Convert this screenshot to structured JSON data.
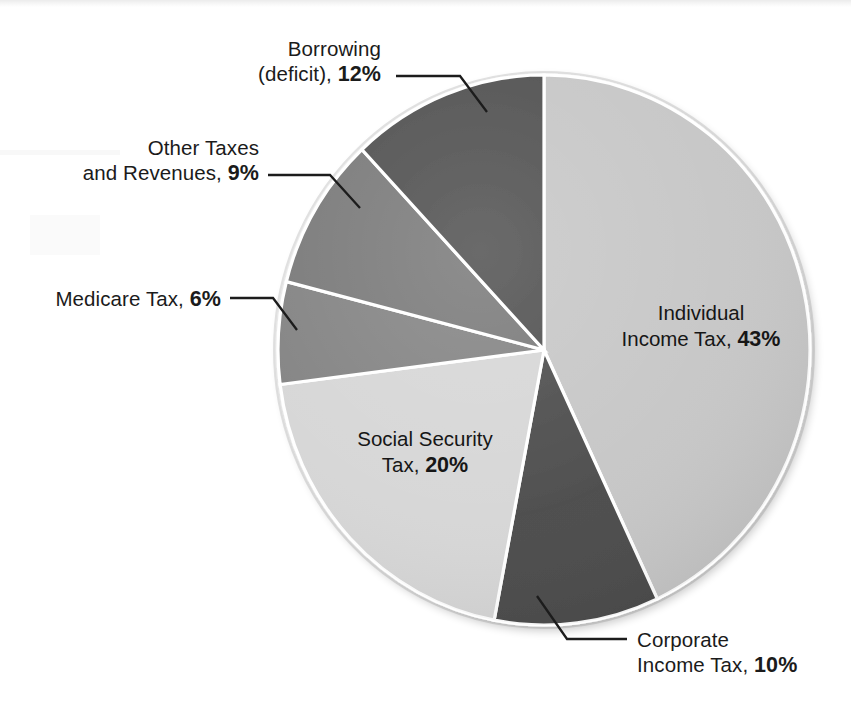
{
  "chart_data": {
    "type": "pie",
    "title": "",
    "subtitle": "",
    "xlabel": "",
    "ylabel": "",
    "legend_position": "none",
    "grid": false,
    "units": "percent",
    "total": 100,
    "start_angle_deg": 0,
    "direction": "clockwise",
    "categories": [
      "Individual Income Tax",
      "Corporate Income Tax",
      "Social Security Tax",
      "Medicare Tax",
      "Other Taxes and Revenues",
      "Borrowing (deficit)"
    ],
    "values": [
      43,
      10,
      20,
      6,
      9,
      12
    ],
    "slices": [
      {
        "id": "individual-income-tax",
        "name": "Individual",
        "name_line2": "Income Tax,",
        "full_name": "Individual Income Tax",
        "value": 43,
        "value_text": "43%",
        "color": "#c6c6c6",
        "label_placement": "inside",
        "start_deg": 0,
        "end_deg": 154.8
      },
      {
        "id": "corporate-income-tax",
        "name": "Corporate",
        "name_line2": "Income Tax,",
        "full_name": "Corporate Income Tax",
        "value": 10,
        "value_text": "10%",
        "color": "#4b4b4b",
        "label_placement": "callout",
        "start_deg": 154.8,
        "end_deg": 190.8
      },
      {
        "id": "social-security-tax",
        "name": "Social Security",
        "name_line2": "Tax,",
        "full_name": "Social Security Tax",
        "value": 20,
        "value_text": "20%",
        "color": "#d6d6d6",
        "label_placement": "inside",
        "start_deg": 190.8,
        "end_deg": 262.8
      },
      {
        "id": "medicare-tax",
        "name": "Medicare Tax,",
        "name_line2": "",
        "full_name": "Medicare Tax",
        "value": 6,
        "value_text": "6%",
        "color": "#828282",
        "label_placement": "callout",
        "start_deg": 262.8,
        "end_deg": 284.4
      },
      {
        "id": "other-taxes-and-revenues",
        "name": "Other Taxes",
        "name_line2": "and Revenues,",
        "full_name": "Other Taxes and Revenues",
        "value": 9,
        "value_text": "9%",
        "color": "#787878",
        "label_placement": "callout",
        "start_deg": 284.4,
        "end_deg": 316.8
      },
      {
        "id": "borrowing-deficit",
        "name": "Borrowing",
        "name_line2": "(deficit),",
        "full_name": "Borrowing (deficit)",
        "value": 12,
        "value_text": "12%",
        "color": "#4e4e4e",
        "label_placement": "callout",
        "start_deg": 316.8,
        "end_deg": 360
      }
    ]
  },
  "labels": {
    "borrowing": {
      "line1": "Borrowing",
      "line2": "(deficit),",
      "pct": "12%"
    },
    "other_taxes": {
      "line1": "Other Taxes",
      "line2": "and Revenues,",
      "pct": "9%"
    },
    "medicare": {
      "line1": "Medicare Tax,",
      "pct": "6%"
    },
    "individual": {
      "line1": "Individual",
      "line2": "Income Tax,",
      "pct": "43%"
    },
    "social_security": {
      "line1": "Social Security",
      "line2": "Tax,",
      "pct": "20%"
    },
    "corporate": {
      "line1": "Corporate",
      "line2": "Income Tax,",
      "pct": "10%"
    }
  },
  "colors": {
    "background": "#ffffff",
    "text": "#1b1b1b",
    "slice_separator": "#ffffff",
    "leader_line": "#1c1c1c",
    "pie_rim": "#e9e9e9"
  }
}
